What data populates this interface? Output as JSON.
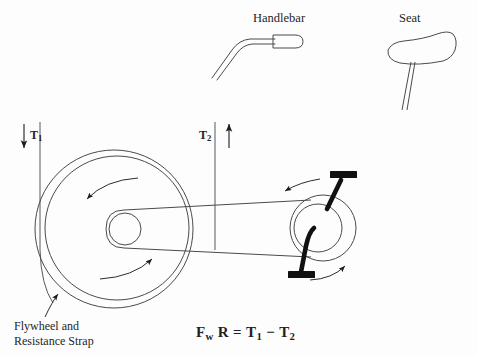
{
  "diagram": {
    "title_parts": {
      "handlebar": "Handlebar",
      "seat": "Seat"
    },
    "labels": {
      "tension_left": "T",
      "tension_left_sub": "1",
      "tension_right": "T",
      "tension_right_sub": "2",
      "flywheel_line1": "Flywheel and",
      "flywheel_line2": "Resistance Strap"
    },
    "formula": {
      "force": "F",
      "force_sub": "w",
      "radius": "R",
      "equals": "=",
      "t1": "T",
      "t1_sub": "1",
      "minus": "−",
      "t2": "T",
      "t2_sub": "2",
      "full_text": "Fw R = T1 - T2"
    },
    "colors": {
      "background": "#fdfdfd",
      "stroke": "#3a3a3a",
      "ink": "#241f1f",
      "solid_black": "#111111"
    },
    "parts": [
      {
        "name": "flywheel",
        "kind": "circle",
        "cx": 115,
        "cy": 228,
        "r": 73
      },
      {
        "name": "resistance-strap",
        "kind": "circle",
        "cx": 113,
        "cy": 229,
        "r": 79
      },
      {
        "name": "flywheel-hub",
        "kind": "circle",
        "cx": 125,
        "cy": 229,
        "r": 16
      },
      {
        "name": "crank-sprocket",
        "kind": "circle",
        "cx": 321,
        "cy": 228,
        "r": 33
      },
      {
        "name": "crank-inner",
        "kind": "circle",
        "cx": 318,
        "cy": 228,
        "r": 24
      },
      {
        "name": "belt",
        "kind": "band"
      },
      {
        "name": "pedal-top",
        "kind": "bar"
      },
      {
        "name": "pedal-bottom",
        "kind": "bar"
      }
    ],
    "arrows": {
      "t1_direction": "down",
      "t2_direction": "up",
      "flywheel_rotation": "counterclockwise",
      "crank_rotation": "counterclockwise"
    }
  }
}
